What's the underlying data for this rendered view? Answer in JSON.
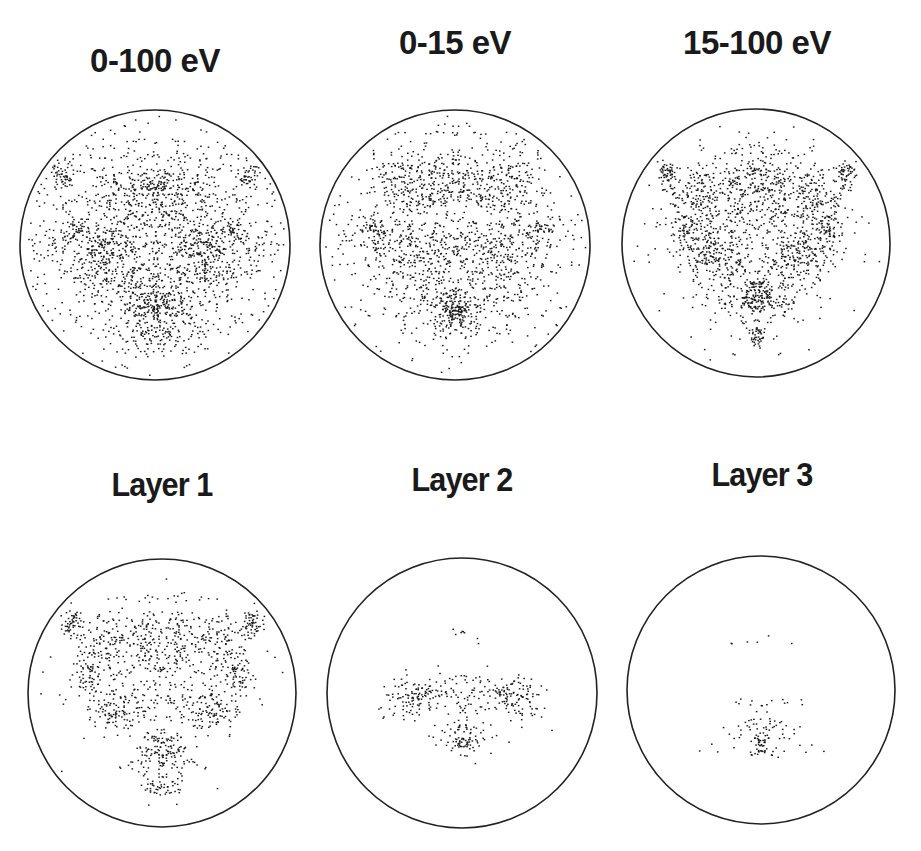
{
  "figure": {
    "rows": 2,
    "cols": 3,
    "dot_color": "#1a1a1a",
    "circle_stroke": "#222222"
  },
  "panels": [
    {
      "title": "0-100 eV",
      "title_x": 155,
      "title_y": 42
    },
    {
      "title": "0-15 eV",
      "title_x": 455,
      "title_y": 24
    },
    {
      "title": "15-100 eV",
      "title_x": 757,
      "title_y": 24
    },
    {
      "title": "Layer 1",
      "title_x": 162,
      "title_y": 465
    },
    {
      "title": "Layer 2",
      "title_x": 462,
      "title_y": 460
    },
    {
      "title": "Layer 3",
      "title_x": 762,
      "title_y": 455
    }
  ],
  "chart_data": [
    {
      "type": "scatter",
      "title": "0-100 eV",
      "circle": {
        "cx": 155,
        "cy": 245,
        "r": 135
      },
      "xlim": [
        -1,
        1
      ],
      "ylim": [
        -1,
        1
      ],
      "grid": false,
      "density": "very high",
      "clusters": [
        {
          "x": 0.0,
          "y": 0.45,
          "sx": 0.1,
          "sy": 0.05,
          "n": 60,
          "label": "bottom dense spot"
        },
        {
          "x": 0.0,
          "y": 0.38,
          "sx": 0.22,
          "sy": 0.15,
          "n": 180
        },
        {
          "x": 0.0,
          "y": -0.38,
          "sx": 0.25,
          "sy": 0.13,
          "n": 200
        },
        {
          "x": -0.68,
          "y": -0.53,
          "sx": 0.04,
          "sy": 0.05,
          "n": 30
        },
        {
          "x": 0.68,
          "y": -0.53,
          "sx": 0.04,
          "sy": 0.05,
          "n": 30
        },
        {
          "x": -0.6,
          "y": -0.12,
          "sx": 0.07,
          "sy": 0.05,
          "n": 30
        },
        {
          "x": 0.6,
          "y": -0.12,
          "sx": 0.07,
          "sy": 0.05,
          "n": 30
        },
        {
          "x": -0.38,
          "y": 0.05,
          "sx": 0.13,
          "sy": 0.14,
          "n": 140
        },
        {
          "x": 0.38,
          "y": 0.05,
          "sx": 0.13,
          "sy": 0.14,
          "n": 140
        },
        {
          "x": 0.0,
          "y": -0.05,
          "sx": 0.55,
          "sy": 0.45,
          "n": 700
        },
        {
          "x": 0.0,
          "y": 0.68,
          "sx": 0.12,
          "sy": 0.07,
          "n": 50
        },
        {
          "x": 0.0,
          "y": 0.0,
          "sx": 0.8,
          "sy": 0.8,
          "n": 120
        }
      ]
    },
    {
      "type": "scatter",
      "title": "0-15 eV",
      "circle": {
        "cx": 455,
        "cy": 245,
        "r": 135
      },
      "xlim": [
        -1,
        1
      ],
      "ylim": [
        -1,
        1
      ],
      "grid": false,
      "density": "high",
      "clusters": [
        {
          "x": 0.0,
          "y": 0.5,
          "sx": 0.06,
          "sy": 0.06,
          "n": 60,
          "label": "bottom dense spot"
        },
        {
          "x": 0.0,
          "y": 0.45,
          "sx": 0.16,
          "sy": 0.12,
          "n": 140
        },
        {
          "x": 0.0,
          "y": -0.45,
          "sx": 0.22,
          "sy": 0.12,
          "n": 140
        },
        {
          "x": -0.62,
          "y": -0.13,
          "sx": 0.06,
          "sy": 0.04,
          "n": 25
        },
        {
          "x": 0.62,
          "y": -0.13,
          "sx": 0.06,
          "sy": 0.04,
          "n": 25
        },
        {
          "x": -0.38,
          "y": -0.45,
          "sx": 0.1,
          "sy": 0.12,
          "n": 60
        },
        {
          "x": 0.38,
          "y": -0.45,
          "sx": 0.1,
          "sy": 0.12,
          "n": 60
        },
        {
          "x": -0.35,
          "y": 0.05,
          "sx": 0.18,
          "sy": 0.13,
          "n": 120
        },
        {
          "x": 0.35,
          "y": 0.05,
          "sx": 0.18,
          "sy": 0.13,
          "n": 120
        },
        {
          "x": 0.0,
          "y": -0.1,
          "sx": 0.6,
          "sy": 0.45,
          "n": 550
        },
        {
          "x": 0.0,
          "y": 0.0,
          "sx": 0.8,
          "sy": 0.8,
          "n": 130
        }
      ]
    },
    {
      "type": "scatter",
      "title": "15-100 eV",
      "circle": {
        "cx": 756,
        "cy": 243,
        "r": 134
      },
      "xlim": [
        -1,
        1
      ],
      "ylim": [
        -1,
        1
      ],
      "grid": false,
      "density": "high",
      "clusters": [
        {
          "x": 0.0,
          "y": 0.4,
          "sx": 0.08,
          "sy": 0.05,
          "n": 60,
          "label": "bottom dense spot"
        },
        {
          "x": 0.0,
          "y": 0.38,
          "sx": 0.16,
          "sy": 0.12,
          "n": 130
        },
        {
          "x": 0.0,
          "y": 0.68,
          "sx": 0.06,
          "sy": 0.03,
          "n": 30
        },
        {
          "x": 0.0,
          "y": -0.42,
          "sx": 0.18,
          "sy": 0.18,
          "n": 200
        },
        {
          "x": -0.68,
          "y": -0.53,
          "sx": 0.04,
          "sy": 0.05,
          "n": 35
        },
        {
          "x": 0.68,
          "y": -0.53,
          "sx": 0.04,
          "sy": 0.05,
          "n": 35
        },
        {
          "x": -0.54,
          "y": -0.12,
          "sx": 0.05,
          "sy": 0.06,
          "n": 30
        },
        {
          "x": 0.54,
          "y": -0.12,
          "sx": 0.05,
          "sy": 0.06,
          "n": 30
        },
        {
          "x": -0.35,
          "y": 0.08,
          "sx": 0.12,
          "sy": 0.1,
          "n": 110
        },
        {
          "x": 0.35,
          "y": 0.08,
          "sx": 0.12,
          "sy": 0.1,
          "n": 110
        },
        {
          "x": -0.45,
          "y": -0.35,
          "sx": 0.13,
          "sy": 0.13,
          "n": 110
        },
        {
          "x": 0.45,
          "y": -0.35,
          "sx": 0.13,
          "sy": 0.13,
          "n": 110
        },
        {
          "x": 0.0,
          "y": -0.05,
          "sx": 0.35,
          "sy": 0.35,
          "n": 250
        }
      ]
    },
    {
      "type": "scatter",
      "title": "Layer 1",
      "circle": {
        "cx": 162,
        "cy": 693,
        "r": 134
      },
      "xlim": [
        -1,
        1
      ],
      "ylim": [
        -1,
        1
      ],
      "grid": false,
      "density": "medium",
      "clusters": [
        {
          "x": 0.0,
          "y": 0.4,
          "sx": 0.08,
          "sy": 0.05,
          "n": 45,
          "label": "bottom dense spot"
        },
        {
          "x": 0.0,
          "y": 0.7,
          "sx": 0.07,
          "sy": 0.03,
          "n": 25
        },
        {
          "x": 0.0,
          "y": 0.52,
          "sx": 0.12,
          "sy": 0.08,
          "n": 50
        },
        {
          "x": 0.0,
          "y": -0.4,
          "sx": 0.16,
          "sy": 0.18,
          "n": 160
        },
        {
          "x": -0.68,
          "y": -0.52,
          "sx": 0.04,
          "sy": 0.05,
          "n": 35
        },
        {
          "x": 0.68,
          "y": -0.52,
          "sx": 0.04,
          "sy": 0.05,
          "n": 35
        },
        {
          "x": -0.55,
          "y": -0.13,
          "sx": 0.05,
          "sy": 0.06,
          "n": 30
        },
        {
          "x": 0.55,
          "y": -0.13,
          "sx": 0.05,
          "sy": 0.06,
          "n": 30
        },
        {
          "x": -0.35,
          "y": 0.12,
          "sx": 0.12,
          "sy": 0.08,
          "n": 70
        },
        {
          "x": 0.35,
          "y": 0.12,
          "sx": 0.12,
          "sy": 0.08,
          "n": 70
        },
        {
          "x": -0.45,
          "y": -0.35,
          "sx": 0.13,
          "sy": 0.13,
          "n": 80
        },
        {
          "x": 0.45,
          "y": -0.35,
          "sx": 0.13,
          "sy": 0.13,
          "n": 80
        },
        {
          "x": 0.0,
          "y": -0.05,
          "sx": 0.32,
          "sy": 0.3,
          "n": 140
        }
      ]
    },
    {
      "type": "scatter",
      "title": "Layer 2",
      "circle": {
        "cx": 462,
        "cy": 693,
        "r": 135
      },
      "xlim": [
        -1,
        1
      ],
      "ylim": [
        -1,
        1
      ],
      "grid": false,
      "density": "low",
      "clusters": [
        {
          "x": 0.0,
          "y": 0.37,
          "sx": 0.03,
          "sy": 0.02,
          "n": 14,
          "label": "bottom dense spot"
        },
        {
          "x": 0.0,
          "y": 0.32,
          "sx": 0.08,
          "sy": 0.08,
          "n": 40
        },
        {
          "x": -0.38,
          "y": 0.02,
          "sx": 0.1,
          "sy": 0.07,
          "n": 70
        },
        {
          "x": 0.38,
          "y": 0.02,
          "sx": 0.1,
          "sy": 0.07,
          "n": 70
        },
        {
          "x": 0.0,
          "y": -0.03,
          "sx": 0.14,
          "sy": 0.07,
          "n": 45
        },
        {
          "x": 0.0,
          "y": -0.4,
          "sx": 0.08,
          "sy": 0.03,
          "n": 6
        },
        {
          "x": 0.0,
          "y": 0.2,
          "sx": 0.35,
          "sy": 0.1,
          "n": 25
        }
      ]
    },
    {
      "type": "scatter",
      "title": "Layer 3",
      "circle": {
        "cx": 761,
        "cy": 690,
        "r": 134
      },
      "xlim": [
        -1,
        1
      ],
      "ylim": [
        -1,
        1
      ],
      "grid": false,
      "density": "very low",
      "clusters": [
        {
          "x": 0.0,
          "y": 0.46,
          "sx": 0.03,
          "sy": 0.02,
          "n": 8,
          "label": "bottom dense spot"
        },
        {
          "x": 0.0,
          "y": 0.35,
          "sx": 0.09,
          "sy": 0.09,
          "n": 45
        },
        {
          "x": 0.0,
          "y": 0.1,
          "sx": 0.14,
          "sy": 0.02,
          "n": 9
        },
        {
          "x": 0.0,
          "y": 0.35,
          "sx": 0.25,
          "sy": 0.08,
          "n": 14
        },
        {
          "x": 0.0,
          "y": -0.36,
          "sx": 0.14,
          "sy": 0.03,
          "n": 5
        }
      ]
    }
  ]
}
